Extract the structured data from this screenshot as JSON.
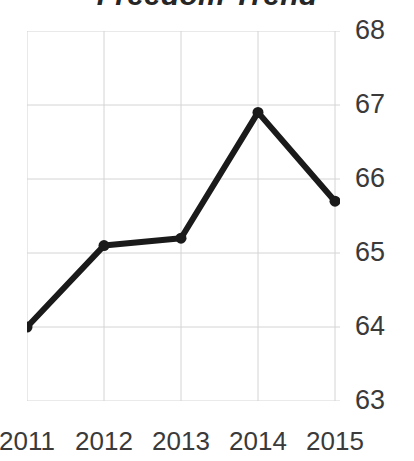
{
  "chart_data": {
    "type": "line",
    "title": "Freedom Trend",
    "xlabel": "",
    "ylabel": "",
    "categories": [
      "2011",
      "2012",
      "2013",
      "2014",
      "2015"
    ],
    "x": [
      2011,
      2012,
      2013,
      2014,
      2015
    ],
    "values": [
      64.0,
      65.1,
      65.2,
      66.9,
      65.7
    ],
    "series": [
      {
        "name": "Freedom Trend",
        "values": [
          64.0,
          65.1,
          65.2,
          66.9,
          65.7
        ]
      }
    ],
    "ylim": [
      63,
      68
    ],
    "yticks": [
      68,
      67,
      66,
      65,
      64,
      63
    ],
    "ytick_labels": [
      "68",
      "67",
      "66",
      "65",
      "64",
      "63"
    ],
    "xtick_labels": [
      "2011",
      "2012",
      "2013",
      "2014",
      "2015"
    ],
    "grid": true,
    "grid_axes": "both",
    "legend": false,
    "legend_position": "none",
    "y_axis_side": "right",
    "line_color": "#1a1a1a",
    "marker_color": "#1a1a1a",
    "grid_color": "#d4d4d4",
    "label_color": "#3a3a3a",
    "title_color": "#262626",
    "background_color": "#ffffff",
    "line_width": 6,
    "marker_size": 11,
    "marker_shape": "circle"
  }
}
